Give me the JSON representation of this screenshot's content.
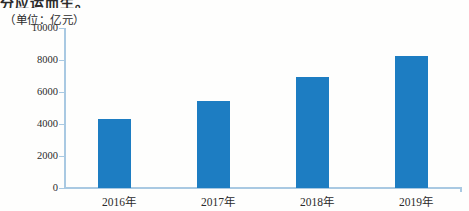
{
  "page": {
    "clipped_text": "分应运而生。"
  },
  "chart": {
    "unit_label": "（单位：亿元）"
  },
  "chart_data": {
    "type": "bar",
    "title": "",
    "subtitle": "",
    "unit": "亿元",
    "categories": [
      "2016年",
      "2017年",
      "2018年",
      "2019年"
    ],
    "values": [
      4300,
      5400,
      6900,
      8200
    ],
    "yticks": [
      0,
      2000,
      4000,
      6000,
      8000,
      10000
    ],
    "ylim": [
      0,
      10000
    ],
    "xlabel": "",
    "ylabel": "（单位：亿元）",
    "grid": false,
    "legend": "none",
    "bar_color": "#1d7dc2",
    "axis_color": "#a9c9e2",
    "text_color": "#2b2b2b"
  }
}
